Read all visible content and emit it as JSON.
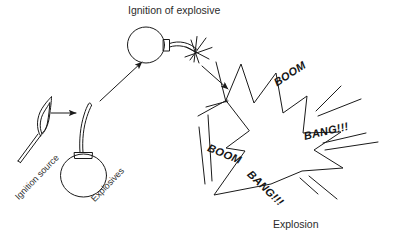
{
  "figure": {
    "title": "Ignition of explosive",
    "caption": "Explosion",
    "background_color": "#ffffff",
    "ink_color": "#1a1a1a"
  },
  "labels": {
    "ignition_source": "Ignition source",
    "explosives": "Explosives",
    "boom_top": "BOOM",
    "boom_left": "BOOM",
    "bang_right": "BANG!!!",
    "bang_bottom": "BANG!!!"
  },
  "stages": [
    {
      "name": "ignition-source",
      "label": "Ignition source",
      "icon": "lit-match-icon"
    },
    {
      "name": "explosives",
      "label": "Explosives",
      "icon": "bomb-icon"
    },
    {
      "name": "ignition-of-explosive",
      "label": "Ignition of explosive",
      "icon": "bomb-with-lit-fuse-icon"
    },
    {
      "name": "explosion",
      "label": "Explosion",
      "icon": "explosion-burst-icon"
    }
  ],
  "arrows": [
    {
      "name": "arrow-match-to-bomb",
      "direction": "right"
    },
    {
      "name": "arrow-bomb-to-ignition",
      "direction": "up-right"
    },
    {
      "name": "arrow-ignition-to-explosion",
      "direction": "down-right"
    }
  ]
}
